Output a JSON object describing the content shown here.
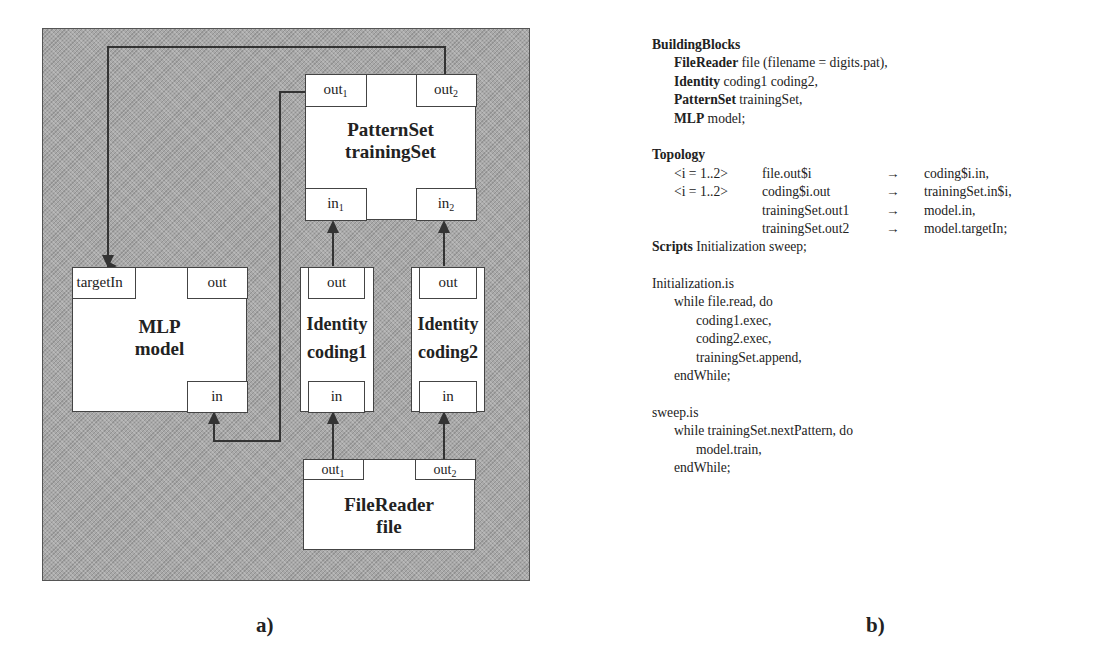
{
  "diagram": {
    "caption": "a)",
    "blocks": [
      {
        "id": "trainingSet",
        "type": "PatternSet",
        "instance": "trainingSet",
        "ports_out": [
          "out",
          "out"
        ],
        "ports_out_sub": [
          "1",
          "2"
        ],
        "ports_in": [
          "in",
          "in"
        ],
        "ports_in_sub": [
          "1",
          "2"
        ]
      },
      {
        "id": "model",
        "type": "MLP",
        "instance": "model",
        "port_target": "targetIn",
        "port_out": "out",
        "port_in": "in"
      },
      {
        "id": "coding1",
        "type": "Identity",
        "instance": "coding1",
        "port_out": "out",
        "port_in": "in"
      },
      {
        "id": "coding2",
        "type": "Identity",
        "instance": "coding2",
        "port_out": "out",
        "port_in": "in"
      },
      {
        "id": "file",
        "type": "FileReader",
        "instance": "file",
        "ports_out": [
          "out",
          "out"
        ],
        "ports_out_sub": [
          "1",
          "2"
        ]
      }
    ],
    "connections": [
      {
        "from": "file.out1",
        "to": "coding1.in"
      },
      {
        "from": "file.out2",
        "to": "coding2.in"
      },
      {
        "from": "coding1.out",
        "to": "trainingSet.in1"
      },
      {
        "from": "coding2.out",
        "to": "trainingSet.in2"
      },
      {
        "from": "trainingSet.out1",
        "to": "model.in"
      },
      {
        "from": "trainingSet.out2",
        "to": "model.targetIn"
      }
    ],
    "colors": {
      "background": "#a9a9a9",
      "box": "#ffffff",
      "line": "#444444"
    }
  },
  "code": {
    "caption": "b)",
    "building_blocks": {
      "header": "BuildingBlocks",
      "lines": [
        {
          "kw": "FileReader",
          "rest": " file (filename = digits.pat),"
        },
        {
          "kw": "Identity",
          "rest": " coding1 coding2,"
        },
        {
          "kw": "PatternSet",
          "rest": " trainingSet,"
        },
        {
          "kw": "MLP",
          "rest": " model;"
        }
      ]
    },
    "topology": {
      "header": "Topology",
      "rows": [
        {
          "range": "<i = 1..2>",
          "src": "file.out$i",
          "arrow": "→",
          "dst": "coding$i.in,"
        },
        {
          "range": "<i = 1..2>",
          "src": "coding$i.out",
          "arrow": "→",
          "dst": "trainingSet.in$i,"
        },
        {
          "range": "",
          "src": "trainingSet.out1",
          "arrow": "→",
          "dst": "model.in,"
        },
        {
          "range": "",
          "src": "trainingSet.out2",
          "arrow": "→",
          "dst": "model.targetIn;"
        }
      ]
    },
    "scripts": {
      "kw": "Scripts",
      "rest": " Initialization sweep;"
    },
    "initialization": {
      "header": "Initialization.is",
      "while": "while file.read, do",
      "body": [
        "coding1.exec,",
        "coding2.exec,",
        "trainingSet.append,"
      ],
      "end": "endWhile;"
    },
    "sweep": {
      "header": "sweep.is",
      "while": "while trainingSet.nextPattern, do",
      "body": [
        "model.train,"
      ],
      "end": "endWhile;"
    }
  }
}
